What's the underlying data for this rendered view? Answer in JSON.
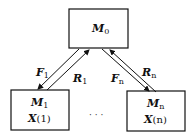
{
  "diagram": {
    "nodes": {
      "top": {
        "name": "M",
        "sub": "0"
      },
      "left": {
        "name": "M",
        "sub": "1",
        "line2_name": "X",
        "line2_arg": "(1)"
      },
      "right": {
        "name": "M",
        "sub": "n",
        "line2_name": "X",
        "line2_arg": "(n)"
      }
    },
    "edges": {
      "f1": {
        "name": "F",
        "sub": "1",
        "from": "M0",
        "to": "M1"
      },
      "r1": {
        "name": "R",
        "sub": "1",
        "from": "M1",
        "to": "M0"
      },
      "fn": {
        "name": "F",
        "sub": "n",
        "from": "M0",
        "to": "Mn"
      },
      "rn": {
        "name": "R",
        "sub": "n",
        "from": "Mn",
        "to": "M0"
      }
    },
    "ellipsis": "· · ·",
    "colors": {
      "stroke": "#111111",
      "background": "#ffffff"
    }
  }
}
